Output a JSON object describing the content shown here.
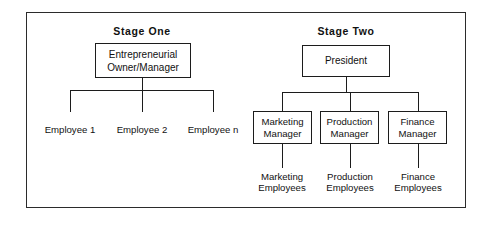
{
  "diagram": {
    "title_stage_one": "Stage One",
    "title_stage_two": "Stage Two",
    "stage_one": {
      "root": "Entrepreneurial\nOwner/Manager",
      "leaves": [
        "Employee 1",
        "Employee 2",
        "Employee n"
      ]
    },
    "stage_two": {
      "root": "President",
      "managers": [
        "Marketing\nManager",
        "Production\nManager",
        "Finance\nManager"
      ],
      "employee_groups": [
        "Marketing\nEmployees",
        "Production\nEmployees",
        "Finance\nEmployees"
      ]
    }
  },
  "style": {
    "line_color": "#1c1c1c",
    "frame_color": "#2b2b2b",
    "text_color": "#111111",
    "background": "#ffffff"
  }
}
